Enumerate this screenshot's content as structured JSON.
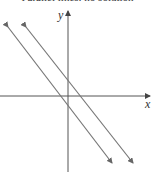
{
  "figure": {
    "title": "Parallel lines: no solution",
    "x_axis_label": "x",
    "y_axis_label": "y"
  },
  "diagram": {
    "type": "coordinate-plane",
    "axis_color": "#555555",
    "line_color": "#777777",
    "lines": [
      {
        "name": "line-1",
        "description": "downward-sloping line with arrows at both ends",
        "from": [
          3,
          20
        ],
        "to": [
          112,
          163
        ]
      },
      {
        "name": "line-2",
        "description": "parallel downward-sloping line with arrows at both ends",
        "from": [
          21,
          20
        ],
        "to": [
          133,
          163
        ]
      }
    ],
    "relationship": "parallel",
    "intersection": "none"
  }
}
